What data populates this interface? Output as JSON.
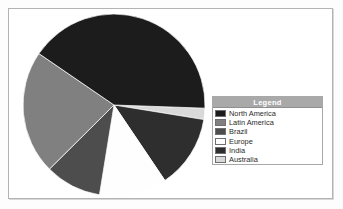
{
  "page": {
    "background_color": "#ffffff",
    "frame_border_color": "#b3b3b3"
  },
  "legend": {
    "title": "Legend",
    "title_background": "#a9a9a9",
    "title_text_color": "#ffffff",
    "border_color": "#a8a8a8",
    "items": [
      {
        "label": "North America",
        "color": "#1c1c1c"
      },
      {
        "label": "Latin America",
        "color": "#808080"
      },
      {
        "label": "Brazil",
        "color": "#4d4d4d"
      },
      {
        "label": "Europe",
        "color": "#fefefe"
      },
      {
        "label": "India",
        "color": "#2e2e2e"
      },
      {
        "label": "Australia",
        "color": "#d9d9d9"
      }
    ]
  },
  "chart_data": {
    "type": "pie",
    "title": "",
    "legend_position": "right",
    "grid": false,
    "start_angle_deg": 2,
    "direction": "clockwise",
    "categories": [
      "Australia",
      "India",
      "Europe",
      "Brazil",
      "Latin America",
      "North America"
    ],
    "values": [
      2,
      13,
      12,
      10,
      22,
      41
    ],
    "unit": "percent",
    "colors": [
      "#d9d9d9",
      "#2e2e2e",
      "#fefefe",
      "#4d4d4d",
      "#808080",
      "#1c1c1c"
    ],
    "series": [
      {
        "name": "Share",
        "values": [
          2,
          13,
          12,
          10,
          22,
          41
        ]
      }
    ],
    "slice_edge_color": "#ffffff"
  }
}
